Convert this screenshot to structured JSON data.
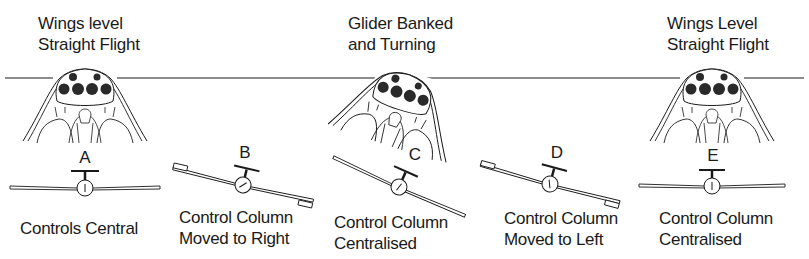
{
  "diagram": {
    "stages": [
      {
        "id": "A",
        "title_line1": "Wings level",
        "title_line2": "Straight Flight",
        "letter": "A",
        "caption_line1": "Controls Central",
        "caption_line2": "",
        "bank_angle_deg": 0,
        "aileron_state": "neutral"
      },
      {
        "id": "B",
        "title_line1": "",
        "title_line2": "",
        "letter": "B",
        "caption_line1": "Control Column",
        "caption_line2": "Moved to Right",
        "bank_angle_deg": 13,
        "aileron_state": "deflected"
      },
      {
        "id": "C",
        "title_line1": "Glider Banked",
        "title_line2": "and Turning",
        "letter": "C",
        "caption_line1": "Control Column",
        "caption_line2": "Centralised",
        "bank_angle_deg": 24,
        "aileron_state": "neutral"
      },
      {
        "id": "D",
        "title_line1": "",
        "title_line2": "",
        "letter": "D",
        "caption_line1": "Control Column",
        "caption_line2": "Moved to Left",
        "bank_angle_deg": 13,
        "aileron_state": "deflected"
      },
      {
        "id": "E",
        "title_line1": "Wings Level",
        "title_line2": "Straight Flight",
        "letter": "E",
        "caption_line1": "Control Column",
        "caption_line2": "Centralised",
        "bank_angle_deg": 0,
        "aileron_state": "neutral"
      }
    ],
    "icons": {
      "cockpit": "cockpit-view-icon",
      "glider": "glider-front-view-icon"
    },
    "colors": {
      "ink": "#1a1a1a",
      "background": "#ffffff",
      "instrument_fill": "#2a2a2a"
    }
  }
}
